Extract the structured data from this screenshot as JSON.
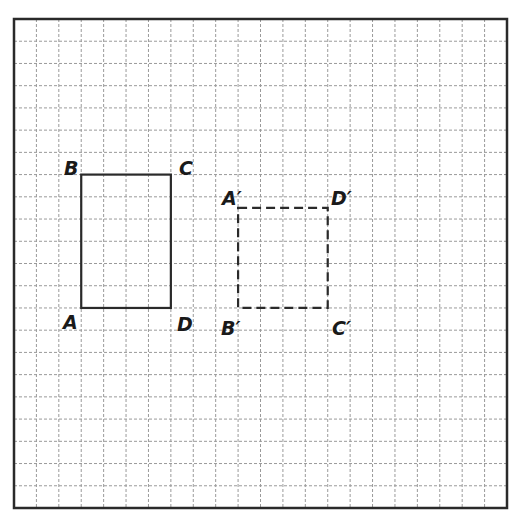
{
  "diagram": {
    "type": "coordinate-grid-transformation",
    "grid": {
      "columns": 22,
      "rows": 22,
      "line_style": "dashed",
      "line_color": "#9a9a9a",
      "frame_color": "#2a2a2a"
    },
    "original_rectangle": {
      "style": "solid",
      "vertices": [
        {
          "label": "A",
          "col": 3,
          "row": 13
        },
        {
          "label": "B",
          "col": 3,
          "row": 7
        },
        {
          "label": "C",
          "col": 7,
          "row": 7
        },
        {
          "label": "D",
          "col": 7,
          "row": 13
        }
      ]
    },
    "image_rectangle": {
      "style": "dashed",
      "vertices": [
        {
          "label": "A′",
          "col": 10,
          "row": 8.5
        },
        {
          "label": "B′",
          "col": 10,
          "row": 13
        },
        {
          "label": "C′",
          "col": 14,
          "row": 13
        },
        {
          "label": "D′",
          "col": 14,
          "row": 8.5
        }
      ]
    },
    "labels": {
      "A": "A",
      "B": "B",
      "C": "C",
      "D": "D",
      "A_prime": "A′",
      "B_prime": "B′",
      "C_prime": "C′",
      "D_prime": "D′"
    }
  }
}
